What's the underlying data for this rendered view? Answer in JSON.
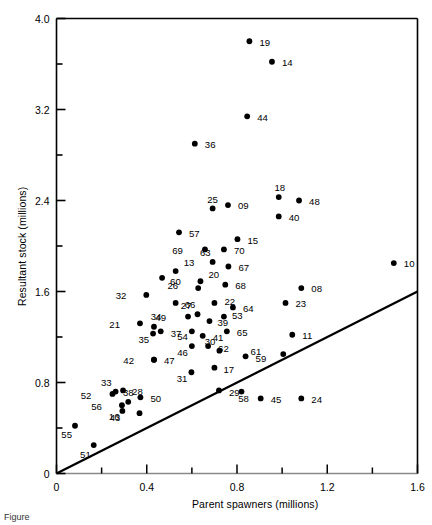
{
  "figure": {
    "caption": "Figure",
    "axis_color": "#000000",
    "point_color": "#000000",
    "line_color": "#000000",
    "background": "#ffffff"
  },
  "chart_data": {
    "type": "scatter",
    "title": "",
    "xlabel": "Parent spawners (millions)",
    "ylabel": "Resultant stock (millions)",
    "xlim": [
      0,
      1.6
    ],
    "ylim": [
      0,
      4.0
    ],
    "xticks": [
      0,
      0.2,
      0.4,
      0.6,
      0.8,
      1.0,
      1.2,
      1.4,
      1.6
    ],
    "xticklabels": [
      "0",
      "",
      "0.4",
      "",
      "0.8",
      "",
      "1.2",
      "",
      "1.6"
    ],
    "yticks": [
      0,
      0.4,
      0.8,
      1.2,
      1.6,
      2.0,
      2.4,
      2.8,
      3.2,
      3.6,
      4.0
    ],
    "yticklabels": [
      "0",
      "",
      "0.8",
      "",
      "1.6",
      "",
      "2.4",
      "",
      "3.2",
      "",
      "4.0"
    ],
    "grid": false,
    "legend": null,
    "reference_line": {
      "name": "replacement-line",
      "description": "1:1 replacement line through origin",
      "x": [
        0,
        1.6
      ],
      "y": [
        0,
        1.6
      ],
      "slope": 1.0,
      "intercept": 0
    },
    "points": [
      {
        "label": "19",
        "x": 0.855,
        "y": 3.8,
        "lx": 10,
        "ly": 1
      },
      {
        "label": "14",
        "x": 0.955,
        "y": 3.62,
        "lx": 10,
        "ly": 1
      },
      {
        "label": "44",
        "x": 0.845,
        "y": 3.14,
        "lx": 10,
        "ly": 1
      },
      {
        "label": "36",
        "x": 0.613,
        "y": 2.9,
        "lx": 10,
        "ly": 1
      },
      {
        "label": "18",
        "x": 0.985,
        "y": 2.43,
        "lx": 1,
        "ly": -9
      },
      {
        "label": "48",
        "x": 1.075,
        "y": 2.4,
        "lx": 10,
        "ly": 1
      },
      {
        "label": "25",
        "x": 0.692,
        "y": 2.33,
        "lx": 0,
        "ly": -9
      },
      {
        "label": "09",
        "x": 0.76,
        "y": 2.36,
        "lx": 10,
        "ly": 1
      },
      {
        "label": "40",
        "x": 0.985,
        "y": 2.26,
        "lx": 10,
        "ly": 1
      },
      {
        "label": "57",
        "x": 0.543,
        "y": 2.12,
        "lx": 10,
        "ly": 1
      },
      {
        "label": "15",
        "x": 0.802,
        "y": 2.06,
        "lx": 10,
        "ly": 1
      },
      {
        "label": "70",
        "x": 0.742,
        "y": 1.97,
        "lx": 10,
        "ly": 1
      },
      {
        "label": "69",
        "x": 0.658,
        "y": 1.97,
        "lx": -22,
        "ly": 1
      },
      {
        "label": "67",
        "x": 0.762,
        "y": 1.82,
        "lx": 10,
        "ly": 1
      },
      {
        "label": "63",
        "x": 0.692,
        "y": 1.86,
        "lx": -2,
        "ly": -9
      },
      {
        "label": "13",
        "x": 0.528,
        "y": 1.78,
        "lx": 8,
        "ly": -8
      },
      {
        "label": "10",
        "x": 1.495,
        "y": 1.85,
        "lx": 10,
        "ly": 1
      },
      {
        "label": "60",
        "x": 0.468,
        "y": 1.72,
        "lx": 8,
        "ly": 4
      },
      {
        "label": "20",
        "x": 0.638,
        "y": 1.69,
        "lx": 8,
        "ly": -7
      },
      {
        "label": "68",
        "x": 0.748,
        "y": 1.66,
        "lx": 10,
        "ly": 1
      },
      {
        "label": "26",
        "x": 0.628,
        "y": 1.63,
        "lx": -20,
        "ly": -2
      },
      {
        "label": "32",
        "x": 0.398,
        "y": 1.57,
        "lx": -20,
        "ly": 1
      },
      {
        "label": "08",
        "x": 1.085,
        "y": 1.63,
        "lx": 10,
        "ly": 1
      },
      {
        "label": "66",
        "x": 0.528,
        "y": 1.5,
        "lx": 9,
        "ly": 2
      },
      {
        "label": "22",
        "x": 0.7,
        "y": 1.5,
        "lx": 10,
        "ly": -1
      },
      {
        "label": "64",
        "x": 0.782,
        "y": 1.46,
        "lx": 10,
        "ly": 1
      },
      {
        "label": "23",
        "x": 1.015,
        "y": 1.5,
        "lx": 10,
        "ly": 1
      },
      {
        "label": "27",
        "x": 0.625,
        "y": 1.4,
        "lx": -6,
        "ly": -9
      },
      {
        "label": "49",
        "x": 0.583,
        "y": 1.38,
        "lx": -22,
        "ly": 1
      },
      {
        "label": "53",
        "x": 0.742,
        "y": 1.38,
        "lx": 8,
        "ly": -1
      },
      {
        "label": "39",
        "x": 0.678,
        "y": 1.34,
        "lx": 8,
        "ly": 2
      },
      {
        "label": "21",
        "x": 0.37,
        "y": 1.32,
        "lx": -20,
        "ly": 1
      },
      {
        "label": "34",
        "x": 0.432,
        "y": 1.29,
        "lx": 2,
        "ly": -10
      },
      {
        "label": "35",
        "x": 0.428,
        "y": 1.23,
        "lx": -4,
        "ly": 6
      },
      {
        "label": "37",
        "x": 0.462,
        "y": 1.25,
        "lx": 10,
        "ly": 2
      },
      {
        "label": "54",
        "x": 0.6,
        "y": 1.25,
        "lx": -4,
        "ly": 5
      },
      {
        "label": "41",
        "x": 0.648,
        "y": 1.21,
        "lx": 10,
        "ly": 2
      },
      {
        "label": "65",
        "x": 0.755,
        "y": 1.25,
        "lx": 10,
        "ly": 1
      },
      {
        "label": "11",
        "x": 1.045,
        "y": 1.22,
        "lx": 10,
        "ly": 1
      },
      {
        "label": "46",
        "x": 0.6,
        "y": 1.12,
        "lx": -4,
        "ly": 6
      },
      {
        "label": "62",
        "x": 0.672,
        "y": 1.12,
        "lx": 10,
        "ly": 2
      },
      {
        "label": "30",
        "x": 0.722,
        "y": 1.08,
        "lx": -4,
        "ly": -9
      },
      {
        "label": "61",
        "x": 1.005,
        "y": 1.05,
        "lx": -22,
        "ly": -2
      },
      {
        "label": "42",
        "x": 0.432,
        "y": 1.0,
        "lx": -20,
        "ly": 1
      },
      {
        "label": "47",
        "x": 0.432,
        "y": 1.0,
        "lx": 10,
        "ly": 1
      },
      {
        "label": "17",
        "x": 0.7,
        "y": 0.93,
        "lx": 9,
        "ly": 2
      },
      {
        "label": "59",
        "x": 0.838,
        "y": 1.03,
        "lx": 10,
        "ly": 2
      },
      {
        "label": "31",
        "x": 0.598,
        "y": 0.89,
        "lx": -4,
        "ly": 6
      },
      {
        "label": "33",
        "x": 0.262,
        "y": 0.72,
        "lx": -4,
        "ly": -9
      },
      {
        "label": "28",
        "x": 0.295,
        "y": 0.73,
        "lx": 9,
        "ly": 1
      },
      {
        "label": "52",
        "x": 0.248,
        "y": 0.7,
        "lx": -21,
        "ly": 2
      },
      {
        "label": "29",
        "x": 0.72,
        "y": 0.73,
        "lx": 10,
        "ly": 2
      },
      {
        "label": "50",
        "x": 0.372,
        "y": 0.67,
        "lx": 10,
        "ly": 1
      },
      {
        "label": "38",
        "x": 0.318,
        "y": 0.63,
        "lx": 0,
        "ly": -9
      },
      {
        "label": "56",
        "x": 0.29,
        "y": 0.6,
        "lx": -20,
        "ly": 1
      },
      {
        "label": "43",
        "x": 0.292,
        "y": 0.55,
        "lx": -2,
        "ly": 7
      },
      {
        "label": "16",
        "x": 0.368,
        "y": 0.53,
        "lx": -20,
        "ly": 3
      },
      {
        "label": "58",
        "x": 0.82,
        "y": 0.72,
        "lx": 2,
        "ly": 7
      },
      {
        "label": "45",
        "x": 0.905,
        "y": 0.66,
        "lx": 10,
        "ly": 1
      },
      {
        "label": "24",
        "x": 1.085,
        "y": 0.66,
        "lx": 10,
        "ly": 1
      },
      {
        "label": "55",
        "x": 0.082,
        "y": 0.42,
        "lx": -3,
        "ly": 9
      },
      {
        "label": "51",
        "x": 0.165,
        "y": 0.25,
        "lx": -3,
        "ly": 10
      }
    ]
  }
}
